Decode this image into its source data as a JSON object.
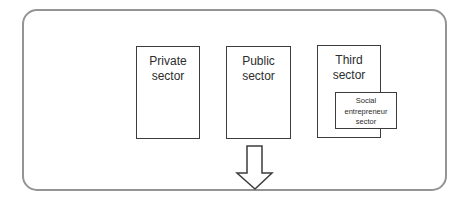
{
  "figure": {
    "boxes": [
      {
        "id": "private-sector",
        "label": "Private sector"
      },
      {
        "id": "public-sector",
        "label": "Public sector"
      },
      {
        "id": "third-sector",
        "label": "Third sector"
      },
      {
        "id": "social-entrepreneur-sector",
        "label": "Social entrepreneur sector"
      }
    ],
    "arrow": {
      "icon": "down-block-arrow"
    }
  },
  "colors": {
    "background": "#ffffff",
    "outer_border": "#949494",
    "box_border": "#3c3c3c",
    "text": "#2d2d2d"
  }
}
